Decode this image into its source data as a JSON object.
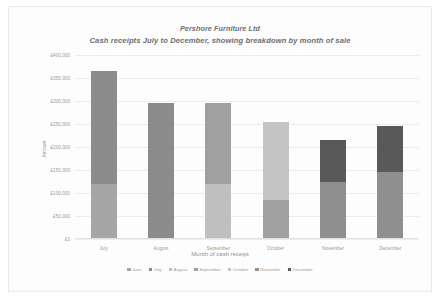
{
  "chart_data": {
    "type": "bar",
    "subtype": "stacked-bar",
    "title": "Pershore Furniture Ltd",
    "subtitle": "Cash receipts July to December, showing breakdown by month of sale",
    "xlabel": "Month of cash receipt",
    "ylabel": "Amount",
    "categories": [
      "July",
      "August",
      "September",
      "October",
      "November",
      "December"
    ],
    "ylim": [
      0,
      400000
    ],
    "ytick_values": [
      400000,
      350000,
      300000,
      250000,
      200000,
      150000,
      100000,
      50000,
      0
    ],
    "ytick_labels": [
      "£400,000",
      "£350,000",
      "£300,000",
      "£250,000",
      "£200,000",
      "£150,000",
      "£100,000",
      "£50,000",
      "£0"
    ],
    "grid": true,
    "legend_position": "bottom",
    "series": [
      {
        "name": "June",
        "color": "#a6a6a6",
        "values": [
          120000,
          0,
          0,
          0,
          0,
          0
        ]
      },
      {
        "name": "July",
        "color": "#8c8c8c",
        "values": [
          245000,
          295000,
          0,
          0,
          0,
          0
        ]
      },
      {
        "name": "August",
        "color": "#bfbfbf",
        "values": [
          0,
          0,
          120000,
          0,
          0,
          0
        ]
      },
      {
        "name": "September",
        "color": "#a0a0a0",
        "values": [
          0,
          0,
          175000,
          85000,
          0,
          0
        ]
      },
      {
        "name": "October",
        "color": "#c4c4c4",
        "values": [
          0,
          0,
          0,
          170000,
          0,
          0
        ]
      },
      {
        "name": "November",
        "color": "#8f8f8f",
        "values": [
          0,
          0,
          0,
          0,
          125000,
          145000
        ]
      },
      {
        "name": "December",
        "color": "#595959",
        "values": [
          0,
          0,
          0,
          0,
          90000,
          100000
        ]
      }
    ],
    "totals": [
      365000,
      295000,
      295000,
      255000,
      215000,
      245000
    ]
  },
  "legend": {
    "items": [
      {
        "label": "June"
      },
      {
        "label": "July"
      },
      {
        "label": "August"
      },
      {
        "label": "September"
      },
      {
        "label": "October"
      },
      {
        "label": "November"
      },
      {
        "label": "December"
      }
    ]
  }
}
